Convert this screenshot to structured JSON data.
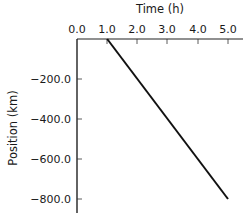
{
  "chart_data": {
    "type": "line",
    "title": "",
    "xlabel": "Time (h)",
    "ylabel": "Position (km)",
    "x_ticks": [
      "0.0",
      "1.0",
      "2.0",
      "3.0",
      "4.0",
      "5.0"
    ],
    "y_ticks": [
      "-200.0",
      "-400.0",
      "-600.0",
      "-800.0"
    ],
    "xlim": [
      0,
      5.5
    ],
    "ylim": [
      -860,
      0
    ],
    "x_axis_position": "top",
    "grid": false,
    "legend": null,
    "series": [
      {
        "name": "position",
        "x": [
          1.0,
          5.0
        ],
        "y": [
          0,
          -800
        ],
        "color": "#111111"
      }
    ]
  },
  "labels": {
    "x_title": "Time (h)",
    "y_title": "Position (km)",
    "x_ticks": [
      "0.0",
      "1.0",
      "2.0",
      "3.0",
      "4.0",
      "5.0"
    ],
    "y_ticks": [
      "−200.0",
      "−400.0",
      "−600.0",
      "−800.0"
    ]
  }
}
